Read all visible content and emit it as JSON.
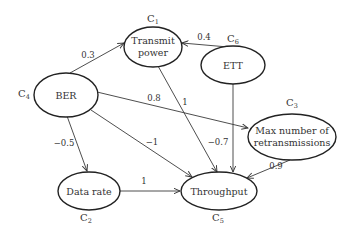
{
  "diagram": {
    "type": "causal-graph",
    "nodes": [
      {
        "id": "C1",
        "prefix": "C",
        "sub": "1",
        "lines": [
          "Transmit",
          "power"
        ]
      },
      {
        "id": "C2",
        "prefix": "C",
        "sub": "2",
        "lines": [
          "Data rate"
        ]
      },
      {
        "id": "C3",
        "prefix": "C",
        "sub": "3",
        "lines": [
          "Max number of",
          "retransmissions"
        ]
      },
      {
        "id": "C4",
        "prefix": "C",
        "sub": "4",
        "lines": [
          "BER"
        ]
      },
      {
        "id": "C5",
        "prefix": "C",
        "sub": "5",
        "lines": [
          "Throughput"
        ]
      },
      {
        "id": "C6",
        "prefix": "C",
        "sub": "6",
        "lines": [
          "ETT"
        ]
      }
    ],
    "edges": [
      {
        "from": "C4",
        "to": "C1",
        "weight": "0.3"
      },
      {
        "from": "C6",
        "to": "C1",
        "weight": "0.4"
      },
      {
        "from": "C4",
        "to": "C3",
        "weight": "0.8"
      },
      {
        "from": "C1",
        "to": "C5",
        "weight": "1"
      },
      {
        "from": "C4",
        "to": "C2",
        "weight": "−0.5"
      },
      {
        "from": "C4",
        "to": "C5",
        "weight": "−1"
      },
      {
        "from": "C6",
        "to": "C5",
        "weight": "−0.7"
      },
      {
        "from": "C3",
        "to": "C5",
        "weight": "0.9"
      },
      {
        "from": "C2",
        "to": "C5",
        "weight": "1"
      }
    ]
  }
}
